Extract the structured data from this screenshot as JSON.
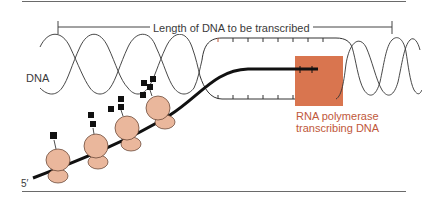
{
  "diagram": {
    "title_label": "Length of DNA to be transcribed",
    "dna_label": "DNA",
    "five_prime_label": "5′",
    "polymerase_label_line1": "RNA polymerase",
    "polymerase_label_line2": "transcribing DNA",
    "colors": {
      "polymerase_box": "#d9754f",
      "ribosome": "#eab79c",
      "strand": "#1a1a1a",
      "polymerase_text": "#c0583a",
      "rules": "#6a6a6a"
    },
    "ribosome_count": 4,
    "elements": [
      "DNA double helix",
      "Transcription bubble (unwound DNA)",
      "RNA polymerase",
      "mRNA strand (5' end)",
      "Ribosomes with nascent polypeptide chains"
    ]
  }
}
